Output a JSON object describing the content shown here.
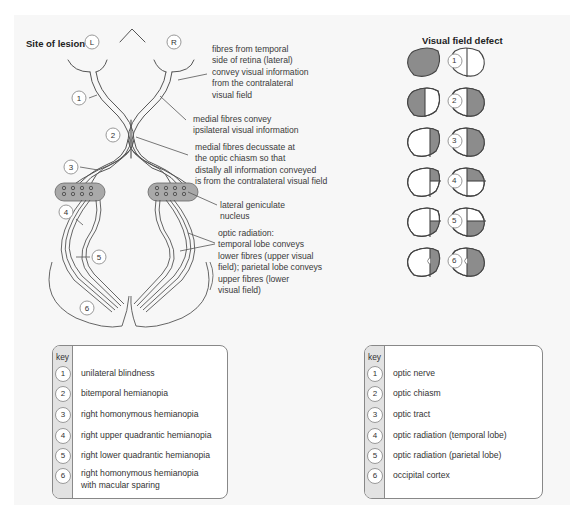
{
  "diagram": {
    "left_title": "Site of lesion",
    "right_title": "Visual field defect",
    "eye_labels": {
      "left": "L",
      "right": "R"
    },
    "annotations": {
      "temporal_fibres": [
        "fibres from temporal",
        "side of retina (lateral)",
        "convey visual information",
        "from the contralateral",
        "visual field"
      ],
      "medial_fibres": [
        "medial fibres convey",
        "ipsilateral visual information"
      ],
      "decussate": [
        "medial fibres decussate at",
        "the optic chiasm so that",
        "distally all information conveyed",
        "is from the contralateral visual field"
      ],
      "lgn": [
        "lateral geniculate",
        "nucleus"
      ],
      "optic_radiation": [
        "optic radiation:",
        "temporal lobe conveys",
        "lower fibres (upper visual",
        "field); parietal lobe conveys",
        "upper fibres (lower",
        "visual field)"
      ]
    },
    "lesion_markers": [
      "1",
      "2",
      "3",
      "4",
      "5",
      "6"
    ],
    "visual_field_defects": [
      {
        "id": "1",
        "left_eye": "fully shaded",
        "right_eye": "clear (midline only)"
      },
      {
        "id": "2",
        "left_eye": "temporal (left) half shaded",
        "right_eye": "temporal (right) half shaded"
      },
      {
        "id": "3",
        "left_eye": "right half shaded",
        "right_eye": "right half shaded"
      },
      {
        "id": "4",
        "left_eye": "right upper quadrant shaded",
        "right_eye": "right upper quadrant shaded"
      },
      {
        "id": "5",
        "left_eye": "right lower quadrant shaded",
        "right_eye": "right lower quadrant shaded"
      },
      {
        "id": "6",
        "left_eye": "right half shaded with macular notch",
        "right_eye": "right half shaded with macular notch"
      }
    ],
    "colors": {
      "shade": "#8c8c8c",
      "line": "#555555",
      "lgn": "#a9a9a9",
      "panel": "#f7f7f7"
    }
  },
  "key_left": {
    "header": "key",
    "items": [
      {
        "num": "1",
        "text": "unilateral blindness"
      },
      {
        "num": "2",
        "text": "bitemporal hemianopia"
      },
      {
        "num": "3",
        "text": "right homonymous hemianopia"
      },
      {
        "num": "4",
        "text": "right upper quadrantic hemianopia"
      },
      {
        "num": "5",
        "text": "right lower quadrantic hemianopia"
      },
      {
        "num": "6",
        "text": "right homonymous hemianopia",
        "text2": "with macular sparing"
      }
    ]
  },
  "key_right": {
    "header": "key",
    "items": [
      {
        "num": "1",
        "text": "optic nerve"
      },
      {
        "num": "2",
        "text": "optic chiasm"
      },
      {
        "num": "3",
        "text": "optic tract"
      },
      {
        "num": "4",
        "text": "optic radiation (temporal lobe)"
      },
      {
        "num": "5",
        "text": "optic radiation (parietal lobe)"
      },
      {
        "num": "6",
        "text": "occipital cortex"
      }
    ]
  }
}
